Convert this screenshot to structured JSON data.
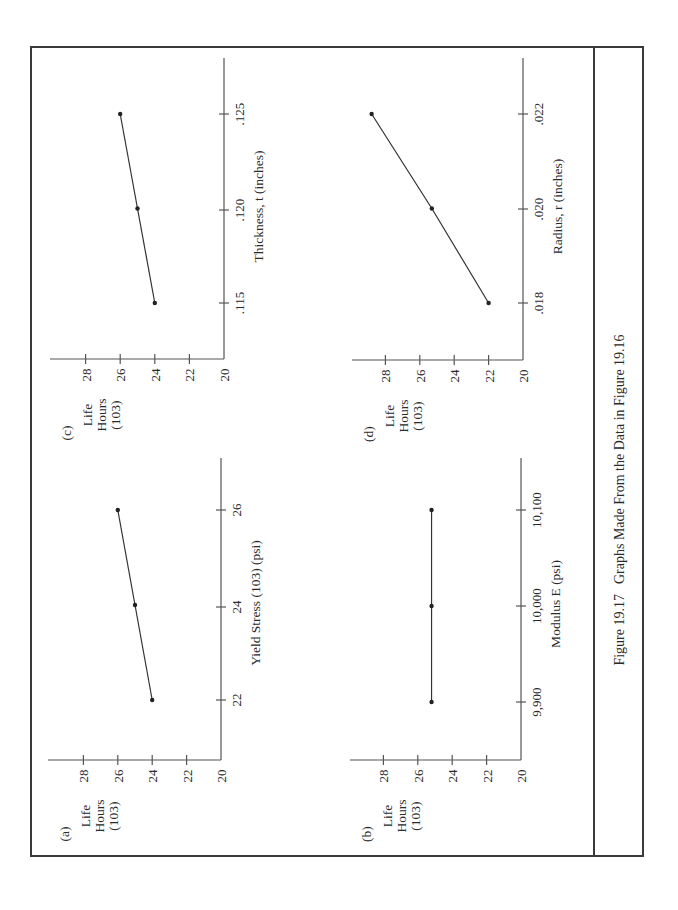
{
  "figure": {
    "caption_number": "Figure 19.17",
    "caption_text": "Graphs Made From the Data in Figure 19.16",
    "orientation": "rotated 90° counter-clockwise"
  },
  "chart_data": [
    {
      "panel": "(a)",
      "type": "line",
      "title": "",
      "xlabel": "Yield Stress (103) (psi)",
      "ylabel": [
        "Life",
        "Hours",
        "(103)"
      ],
      "x_ticks": [
        "22",
        "24",
        "26"
      ],
      "y_ticks": [
        "20",
        "22",
        "24",
        "26",
        "28"
      ],
      "ylim": [
        20,
        30
      ],
      "x": [
        22,
        24,
        26
      ],
      "y": [
        24,
        25,
        26
      ],
      "grid": false
    },
    {
      "panel": "(b)",
      "type": "line",
      "title": "",
      "xlabel": "Modulus E (psi)",
      "ylabel": [
        "Life",
        "Hours",
        "(103)"
      ],
      "x_ticks": [
        "9,900",
        "10,000",
        "10,100"
      ],
      "y_ticks": [
        "20",
        "22",
        "24",
        "26",
        "28"
      ],
      "ylim": [
        20,
        30
      ],
      "x": [
        9900,
        10000,
        10100
      ],
      "y": [
        25.2,
        25.2,
        25.2
      ],
      "grid": false
    },
    {
      "panel": "(c)",
      "type": "line",
      "title": "",
      "xlabel": "Thickness, t  (inches)",
      "ylabel": [
        "Life",
        "Hours",
        "(103)"
      ],
      "x_ticks": [
        ".115",
        ".120",
        ".125"
      ],
      "y_ticks": [
        "20",
        "22",
        "24",
        "26",
        "28"
      ],
      "ylim": [
        20,
        30
      ],
      "x": [
        0.115,
        0.12,
        0.125
      ],
      "y": [
        24,
        25,
        26
      ],
      "grid": false
    },
    {
      "panel": "(d)",
      "type": "line",
      "title": "",
      "xlabel": "Radius, r  (inches)",
      "ylabel": [
        "Life",
        "Hours",
        "(103)"
      ],
      "x_ticks": [
        ".018",
        ".020",
        ".022"
      ],
      "y_ticks": [
        "20",
        "22",
        "24",
        "26",
        "28"
      ],
      "ylim": [
        20,
        30
      ],
      "x": [
        0.018,
        0.02,
        0.022
      ],
      "y": [
        22,
        25.3,
        28.8
      ],
      "grid": false
    }
  ]
}
